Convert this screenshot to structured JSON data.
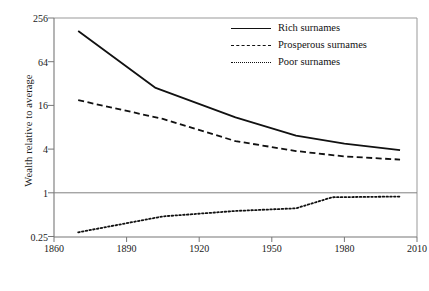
{
  "chart_data": {
    "type": "line",
    "title": "",
    "xlabel": "",
    "ylabel": "Wealth relative to average",
    "xlim": [
      1860,
      2010
    ],
    "ylim": [
      0.25,
      256
    ],
    "yscale": "log",
    "y_log_base": 4,
    "grid": false,
    "legend_position": "top-right",
    "xticks": [
      "1860",
      "1890",
      "1920",
      "1950",
      "1980",
      "2010"
    ],
    "xtick_values": [
      1860,
      1890,
      1920,
      1950,
      1980,
      2010
    ],
    "yticks": [
      "0.25",
      "1",
      "4",
      "16",
      "64",
      "256"
    ],
    "ytick_values": [
      0.25,
      1,
      4,
      16,
      64,
      256
    ],
    "reference_line_y": 1,
    "series": [
      {
        "name": "Rich surnames",
        "style": "solid",
        "color": "#111111",
        "x": [
          1870,
          1902,
          1935,
          1960,
          1980,
          2003
        ],
        "values": [
          170,
          28,
          11,
          6.2,
          4.8,
          3.9
        ]
      },
      {
        "name": "Prosperous surnames",
        "style": "dashed",
        "color": "#111111",
        "x": [
          1870,
          1905,
          1935,
          1960,
          1980,
          2003
        ],
        "values": [
          19,
          10.5,
          5.2,
          3.8,
          3.2,
          2.9
        ]
      },
      {
        "name": "Poor surnames",
        "style": "dotted",
        "color": "#111111",
        "x": [
          1870,
          1905,
          1935,
          1960,
          1975,
          2003
        ],
        "values": [
          0.29,
          0.48,
          0.57,
          0.62,
          0.88,
          0.9
        ]
      }
    ]
  },
  "legend": {
    "items": [
      {
        "label": "Rich surnames"
      },
      {
        "label": "Prosperous surnames"
      },
      {
        "label": "Poor surnames"
      }
    ]
  },
  "axes": {
    "y_title": "Wealth relative to average",
    "y_ticks": [
      "256",
      "64",
      "16",
      "4",
      "1",
      "0.25"
    ],
    "x_ticks": [
      "1860",
      "1890",
      "1920",
      "1950",
      "1980",
      "2010"
    ]
  }
}
